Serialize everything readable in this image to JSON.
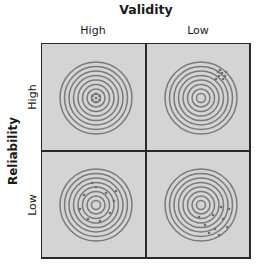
{
  "title_top": "Validity",
  "title_left": "Reliability",
  "columns": [
    "High",
    "Low"
  ],
  "rows": [
    "High",
    "Low"
  ],
  "colors": {
    "panel_bg": "#d4d4d4",
    "ring": "#7a7a7a",
    "hit": "#6e6e6e",
    "border": "#2a2a2a"
  },
  "target": {
    "rings": 8,
    "outer_radius": 36
  },
  "quadrants": [
    {
      "validity": "High",
      "reliability": "High",
      "pattern": "tight cluster at center",
      "hits": [
        [
          0,
          -4
        ],
        [
          3.5,
          -2
        ],
        [
          3.5,
          2
        ],
        [
          0,
          4
        ],
        [
          -3.5,
          2
        ],
        [
          -3.5,
          -2
        ],
        [
          0,
          0
        ]
      ]
    },
    {
      "validity": "Low",
      "reliability": "High",
      "pattern": "tight cluster off-center (upper right)",
      "hits": [
        [
          17,
          -26
        ],
        [
          21,
          -25
        ],
        [
          24,
          -22
        ],
        [
          18,
          -22
        ],
        [
          22,
          -19
        ],
        [
          15,
          -19
        ],
        [
          19,
          -28
        ],
        [
          25,
          -26
        ]
      ]
    },
    {
      "validity": "High",
      "reliability": "Low",
      "pattern": "scattered around center",
      "hits": [
        [
          0,
          -18
        ],
        [
          10,
          -12
        ],
        [
          18,
          -4
        ],
        [
          14,
          8
        ],
        [
          4,
          16
        ],
        [
          -8,
          14
        ],
        [
          -16,
          4
        ],
        [
          -12,
          -10
        ],
        [
          -4,
          -22
        ],
        [
          20,
          -14
        ]
      ]
    },
    {
      "validity": "Low",
      "reliability": "Low",
      "pattern": "scattered, off-center (lower right)",
      "hits": [
        [
          20,
          2
        ],
        [
          28,
          4
        ],
        [
          12,
          10
        ],
        [
          22,
          14
        ],
        [
          4,
          20
        ],
        [
          14,
          24
        ],
        [
          26,
          22
        ],
        [
          -2,
          12
        ],
        [
          8,
          28
        ],
        [
          18,
          30
        ]
      ]
    }
  ]
}
